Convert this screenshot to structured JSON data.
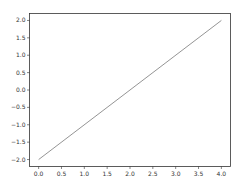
{
  "chart_data": {
    "type": "line",
    "title": "",
    "xlabel": "",
    "ylabel": "",
    "xlim": [
      -0.2,
      4.2
    ],
    "ylim": [
      -2.2,
      2.2
    ],
    "x_ticks": [
      "0.0",
      "0.5",
      "1.0",
      "1.5",
      "2.0",
      "2.5",
      "3.0",
      "3.5",
      "4.0"
    ],
    "y_ticks": [
      "-2.0",
      "-1.5",
      "-1.0",
      "-0.5",
      "0.0",
      "0.5",
      "1.0",
      "1.5",
      "2.0"
    ],
    "grid": false,
    "legend": null,
    "series": [
      {
        "name": "line",
        "color": "#888888",
        "x": [
          0.0,
          4.0
        ],
        "y": [
          -2.0,
          2.0
        ]
      }
    ]
  },
  "colors": {
    "axes": "#333333",
    "line": "#888888",
    "background": "#ffffff"
  }
}
